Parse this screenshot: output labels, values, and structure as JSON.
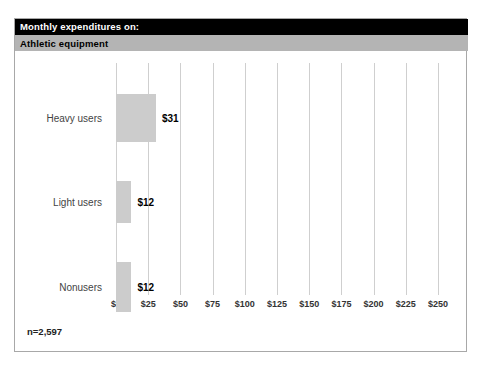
{
  "header": {
    "title": "Monthly expenditures on:",
    "subtitle": "Athletic equipment"
  },
  "footer": {
    "sample_note": "n=2,597"
  },
  "colors": {
    "title_bar_bg": "#000000",
    "title_bar_text": "#ffffff",
    "subtitle_bar_bg": "#b4b4b4",
    "subtitle_bar_text": "#000000",
    "bar_fill": "#cccccc",
    "gridline": "#cfcfcf",
    "frame_border": "#a8a8a8",
    "value_label": "#000000",
    "category_label": "#444444"
  },
  "chart_data": {
    "type": "bar",
    "orientation": "horizontal",
    "title": "Monthly expenditures on:",
    "subtitle": "Athletic equipment",
    "categories": [
      "Heavy users",
      "Light users",
      "Nonusers"
    ],
    "values": [
      31,
      12,
      12
    ],
    "value_labels": [
      "$31",
      "$12",
      "$12"
    ],
    "xlabel": "",
    "ylabel": "",
    "xlim": [
      0,
      250
    ],
    "xticks": [
      0,
      25,
      50,
      75,
      100,
      125,
      150,
      175,
      200,
      225,
      250
    ],
    "xtick_labels": [
      "$0",
      "$25",
      "$50",
      "$75",
      "$100",
      "$125",
      "$150",
      "$175",
      "$200",
      "$225",
      "$250"
    ],
    "grid": true,
    "grid_axis": "x",
    "legend": false,
    "annotation": "n=2,597",
    "sample_size": 2597
  }
}
